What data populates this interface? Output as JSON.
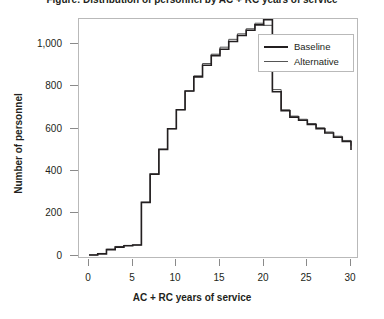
{
  "title": "Figure: Distribution of personnel by AC + RC years of service",
  "axis": {
    "x_title": "AC + RC years of service",
    "y_title": "Number of personnel",
    "x_ticks": [
      "0",
      "5",
      "10",
      "15",
      "20",
      "25",
      "30"
    ],
    "y_ticks": [
      "0",
      "200",
      "400",
      "600",
      "800",
      "1,000"
    ]
  },
  "legend": {
    "items": [
      {
        "label": "Baseline",
        "color": "#231f20"
      },
      {
        "label": "Alternative",
        "color": "#555555"
      }
    ]
  },
  "chart_data": {
    "type": "line",
    "style": "step-post",
    "title": "Distribution of personnel by AC + RC years of service",
    "xlabel": "AC + RC years of service",
    "ylabel": "Number of personnel",
    "xlim": [
      0,
      30
    ],
    "ylim": [
      0,
      1130
    ],
    "grid": false,
    "legend_position": "top-right",
    "x": [
      0,
      1,
      2,
      3,
      4,
      5,
      6,
      7,
      8,
      9,
      10,
      11,
      12,
      13,
      14,
      15,
      16,
      17,
      18,
      19,
      20,
      21,
      22,
      23,
      24,
      25,
      26,
      27,
      28,
      29,
      30
    ],
    "series": [
      {
        "name": "Baseline",
        "color": "#231f20",
        "values": [
          5,
          10,
          30,
          42,
          48,
          52,
          253,
          386,
          503,
          600,
          690,
          778,
          845,
          900,
          945,
          975,
          1012,
          1040,
          1065,
          1090,
          1115,
          775,
          685,
          655,
          640,
          620,
          600,
          580,
          560,
          540,
          500
        ]
      },
      {
        "name": "Alternative",
        "color": "#555555",
        "values": [
          5,
          12,
          32,
          45,
          50,
          52,
          253,
          386,
          503,
          600,
          690,
          778,
          850,
          908,
          952,
          985,
          1022,
          1048,
          1072,
          1098,
          1088,
          785,
          690,
          660,
          645,
          625,
          605,
          585,
          565,
          545,
          520
        ]
      }
    ]
  }
}
